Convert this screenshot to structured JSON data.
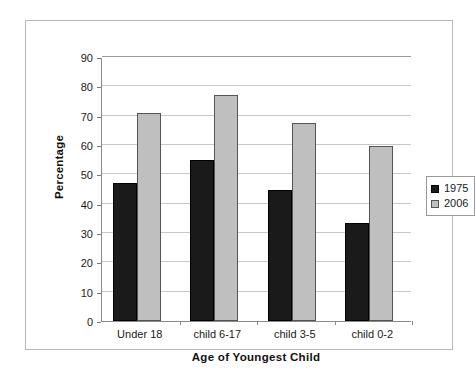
{
  "chart_data": {
    "type": "bar",
    "title": "",
    "xlabel": "Age of Youngest Child",
    "ylabel": "Percentage",
    "categories": [
      "Under 18",
      "child 6-17",
      "child 3-5",
      "child 0-2"
    ],
    "series": [
      {
        "name": "1975",
        "color": "#1a1a1a",
        "values": [
          47,
          55,
          44.5,
          33.5
        ]
      },
      {
        "name": "2006",
        "color": "#bfbfbf",
        "values": [
          71,
          77,
          67.5,
          59.5
        ]
      }
    ],
    "ylim": [
      0,
      90
    ],
    "ytick_step": 10,
    "yticks": [
      "0",
      "10",
      "20",
      "30",
      "40",
      "50",
      "60",
      "70",
      "80",
      "90"
    ],
    "grid": "horizontal",
    "legend_position": "right"
  },
  "legend": {
    "entries": [
      {
        "label": "1975",
        "swatch": "black-square-icon"
      },
      {
        "label": "2006",
        "swatch": "grey-square-icon"
      }
    ]
  }
}
